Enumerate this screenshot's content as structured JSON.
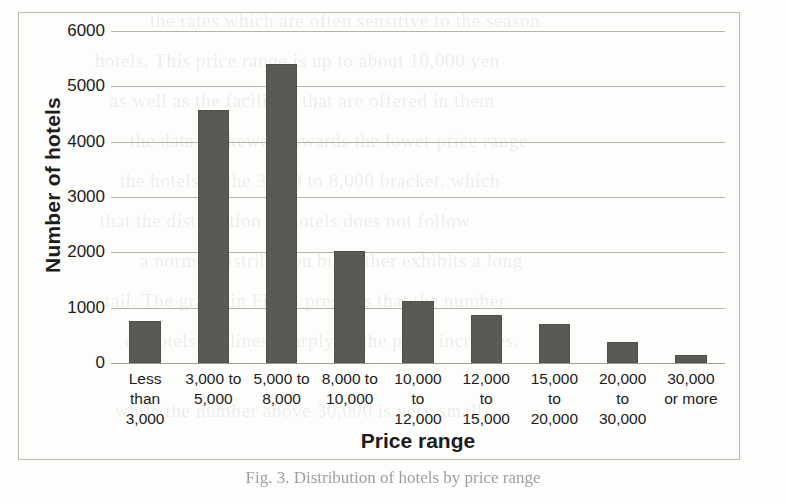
{
  "chart_data": {
    "type": "bar",
    "title": "",
    "xlabel": "Price range",
    "ylabel": "Number of hotels",
    "categories": [
      "Less\nthan\n3,000",
      "3,000 to\n5,000",
      "5,000 to\n8,000",
      "8,000 to\n10,000",
      "10,000\nto\n12,000",
      "12,000\nto\n15,000",
      "15,000\nto\n20,000",
      "20,000\nto\n30,000",
      "30,000\nor more"
    ],
    "values": [
      760,
      4570,
      5410,
      2030,
      1120,
      870,
      710,
      380,
      140
    ],
    "ylim": [
      0,
      6000
    ],
    "yticks": [
      0,
      1000,
      2000,
      3000,
      4000,
      5000,
      6000
    ],
    "ytick_labels": [
      "0",
      "1000",
      "2000",
      "3000",
      "4000",
      "5000",
      "6000"
    ],
    "grid": true,
    "legend": "none",
    "bar_color": "#595955",
    "gridline_color": "#b4b4ae"
  },
  "figure": {
    "caption": "Fig. 3.  Distribution of hotels by price range"
  },
  "background_text": {
    "lines": [
      "the rates which are often sensitive to the season",
      "hotels. This price range is up to about 10,000 yen",
      "as well as the facilities that are offered in them",
      "the data is skewed towards the lower price range",
      "the hotels in the 3,000 to 8,000 bracket, which",
      "that the distribution of hotels does not follow",
      "a normal distribution but rather exhibits a long",
      "tail. The graph in Fig. 3 presents that the number",
      "of hotels declines sharply as the price increases.",
      "while the number above 30,000 is very small."
    ]
  }
}
